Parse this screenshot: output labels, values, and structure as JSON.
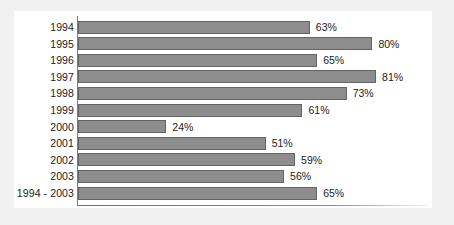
{
  "chart_data": {
    "type": "bar",
    "orientation": "horizontal",
    "title": "",
    "subtitle": "",
    "xlabel": "",
    "ylabel": "",
    "categories": [
      "1994",
      "1995",
      "1996",
      "1997",
      "1998",
      "1999",
      "2000",
      "2001",
      "2002",
      "2003",
      "1994 - 2003"
    ],
    "values": [
      63,
      80,
      65,
      81,
      73,
      61,
      24,
      51,
      59,
      56,
      65
    ],
    "value_labels": [
      "63%",
      "80%",
      "65%",
      "81%",
      "73%",
      "61%",
      "24%",
      "51%",
      "59%",
      "56%",
      "65%"
    ],
    "unit": "%",
    "xlim": [
      0,
      95
    ],
    "grid": false,
    "legend": null,
    "series": [
      {
        "name": "",
        "values": [
          63,
          80,
          65,
          81,
          73,
          61,
          24,
          51,
          59,
          56,
          65
        ]
      }
    ]
  },
  "style": {
    "bar_fill": "#8d8d8d",
    "bar_border": "#646464",
    "axis_color": "#7d7d7d",
    "text_color": "#1b1b1b",
    "figure_background": "#ffffff",
    "page_background": "#f1f1f1"
  }
}
